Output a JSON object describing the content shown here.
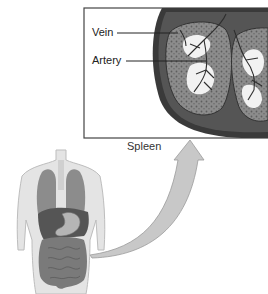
{
  "figure": {
    "inset": {
      "labels": [
        {
          "text": "Vein"
        },
        {
          "text": "Artery"
        }
      ],
      "caption": "Spleen"
    },
    "colors": {
      "frame": "#444444",
      "capsule": "#3a3a3a",
      "pulp": "#8a8a8a",
      "white_pulp": "#f2f2f2",
      "arrow": "#c8c8c8",
      "body": "#e4e4e4",
      "lungs": "#8c8c8c",
      "liver": "#555555",
      "stomach": "#b5b5b5",
      "intestine": "#7a7a7a"
    }
  }
}
